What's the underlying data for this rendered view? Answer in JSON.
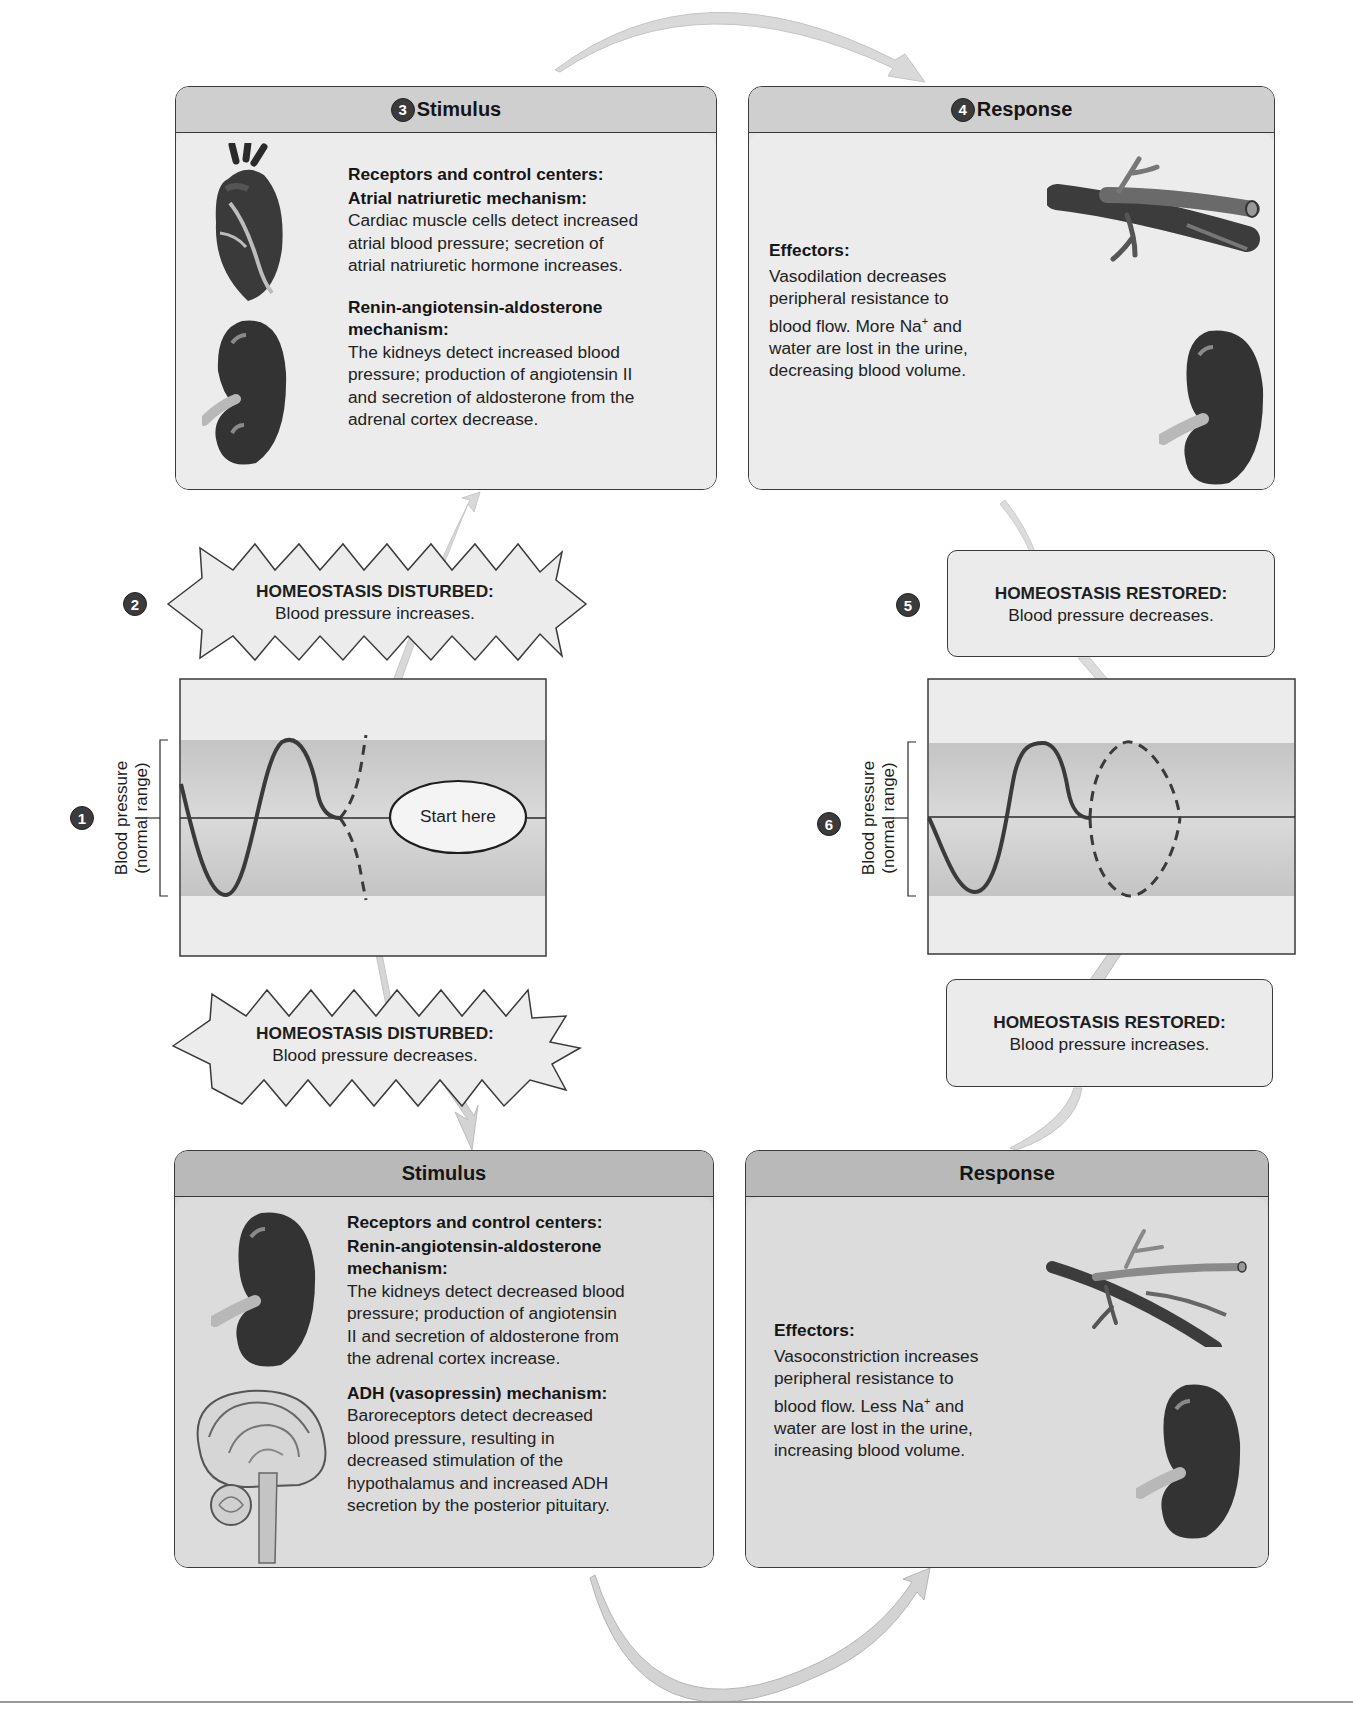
{
  "diagram": {
    "colors": {
      "panel_header": "#cfcfcf",
      "panel_header_dark": "#b9b9b9",
      "panel_body": "#ececec",
      "normal_band": "#c9c9c9",
      "badge": "#3b3b3b",
      "arrow": "#d4d4d4"
    },
    "steps": {
      "s1": "1",
      "s2": "2",
      "s3": "3",
      "s4": "4",
      "s5": "5",
      "s6": "6"
    },
    "top_stimulus": {
      "title": "Stimulus",
      "heading": "Receptors and control centers:",
      "sections": [
        {
          "title": "Atrial natriuretic mechanism:",
          "lines": [
            "Cardiac muscle cells detect increased",
            "atrial blood pressure; secretion of",
            "atrial natriuretic hormone increases."
          ]
        },
        {
          "title_lines": [
            "Renin-angiotensin-aldosterone",
            "mechanism:"
          ],
          "lines": [
            "The kidneys detect increased blood",
            "pressure; production of angiotensin II",
            "and secretion of aldosterone from the",
            "adrenal cortex decrease."
          ]
        }
      ],
      "icons": [
        "heart-icon",
        "kidney-icon"
      ]
    },
    "top_response": {
      "title": "Response",
      "heading": "Effectors:",
      "lines": [
        "Vasodilation decreases",
        "peripheral resistance to",
        "blood flow. More Na",
        "water are lost in the urine,",
        "decreasing blood volume."
      ],
      "superscript": "+",
      "after_superscript": " and",
      "icons": [
        "dilated-vessel-icon",
        "kidney-icon"
      ]
    },
    "disturbed_up": {
      "heading": "HOMEOSTASIS DISTURBED:",
      "text": "Blood pressure increases."
    },
    "disturbed_down": {
      "heading": "HOMEOSTASIS DISTURBED:",
      "text": "Blood pressure decreases."
    },
    "restored_down": {
      "heading": "HOMEOSTASIS RESTORED:",
      "text": "Blood pressure decreases."
    },
    "restored_up": {
      "heading": "HOMEOSTASIS RESTORED:",
      "text": "Blood pressure increases."
    },
    "left_graph": {
      "axis_line1": "Blood pressure",
      "axis_line2": "(normal range)",
      "start_label": "Start here"
    },
    "right_graph": {
      "axis_line1": "Blood pressure",
      "axis_line2": "(normal range)"
    },
    "bottom_stimulus": {
      "title": "Stimulus",
      "heading": "Receptors and control centers:",
      "sections": [
        {
          "title_lines": [
            "Renin-angiotensin-aldosterone",
            "mechanism:"
          ],
          "lines": [
            "The kidneys detect decreased blood",
            "pressure; production of angiotensin",
            "II and secretion of aldosterone from",
            "the adrenal cortex increase."
          ]
        },
        {
          "title": "ADH (vasopressin) mechanism:",
          "lines": [
            "Baroreceptors detect decreased",
            "blood pressure, resulting in",
            "decreased stimulation of the",
            "hypothalamus and increased ADH",
            "secretion by the posterior pituitary."
          ]
        }
      ],
      "icons": [
        "kidney-icon",
        "brain-icon"
      ]
    },
    "bottom_response": {
      "title": "Response",
      "heading": "Effectors:",
      "lines": [
        "Vasoconstriction increases",
        "peripheral resistance to",
        "blood flow. Less Na",
        "water are lost in the urine,",
        "increasing blood volume."
      ],
      "superscript": "+",
      "after_superscript": " and",
      "icons": [
        "constricted-vessel-icon",
        "kidney-icon"
      ]
    }
  }
}
